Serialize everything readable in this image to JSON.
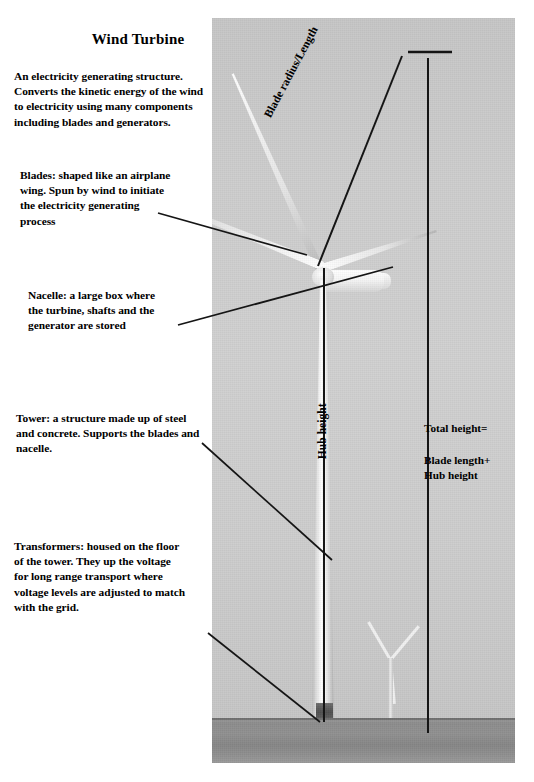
{
  "document": {
    "title": "Wind Turbine",
    "intro": "An electricity generating structure.\nConverts the kinetic energy of the wind\nto electricity using many components\nincluding blades and generators."
  },
  "annotations": [
    {
      "key": "blades",
      "text": "Blades:  shaped like an airplane\nwing.  Spun by wind to initiate\nthe electricity generating\nprocess"
    },
    {
      "key": "nacelle",
      "text": "Nacelle:  a large box where\nthe turbine, shafts and the\ngenerator are stored"
    },
    {
      "key": "tower",
      "text": "Tower:  a structure made up of steel\nand concrete.  Supports the blades and\nnacelle."
    },
    {
      "key": "transformers",
      "text": "Transformers:  housed on the floor\nof the tower.  They up the voltage\nfor long range transport where\nvoltage levels are adjusted to match\nwith the grid."
    }
  ],
  "photo_labels": {
    "blade_radius": "Blade radius/Length",
    "hub_height": "Hub height",
    "total_height": "Total height=",
    "total_height_formula": "Blade length+\nHub height"
  },
  "colors": {
    "page_background": "#ffffff",
    "text": "#000000",
    "sky": "#cdcdcd",
    "ground": "#8c8c8c",
    "turbine_white": "#f7f7f7",
    "annotation_line": "#1a1a1a"
  }
}
